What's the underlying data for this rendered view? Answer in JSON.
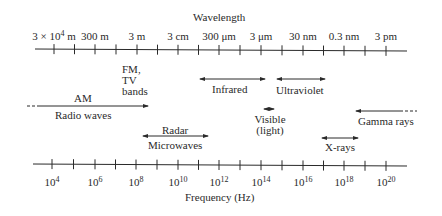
{
  "diagram": {
    "wavelength_axis": {
      "title": "Wavelength",
      "ticks": [
        {
          "label_base": "3 × 10",
          "label_exp": "4",
          "label_unit": " m",
          "x": 54
        },
        {
          "label_base": "300 m",
          "label_exp": "",
          "label_unit": "",
          "x": 95
        },
        {
          "label_base": "3 m",
          "label_exp": "",
          "label_unit": "",
          "x": 137
        },
        {
          "label_base": "3 cm",
          "label_exp": "",
          "label_unit": "",
          "x": 178
        },
        {
          "label_base": "300 μm",
          "label_exp": "",
          "label_unit": "",
          "x": 219
        },
        {
          "label_base": "3 μm",
          "label_exp": "",
          "label_unit": "",
          "x": 261
        },
        {
          "label_base": "30 nm",
          "label_exp": "",
          "label_unit": "",
          "x": 303
        },
        {
          "label_base": "0.3 nm",
          "label_exp": "",
          "label_unit": "",
          "x": 344
        },
        {
          "label_base": "3 pm",
          "label_exp": "",
          "label_unit": "",
          "x": 386
        }
      ]
    },
    "frequency_axis": {
      "title": "Frequency (Hz)",
      "ticks": [
        {
          "label_base": "10",
          "label_exp": "4",
          "x": 52
        },
        {
          "label_base": "10",
          "label_exp": "6",
          "x": 95
        },
        {
          "label_base": "10",
          "label_exp": "8",
          "x": 136
        },
        {
          "label_base": "10",
          "label_exp": "10",
          "x": 178
        },
        {
          "label_base": "10",
          "label_exp": "12",
          "x": 219
        },
        {
          "label_base": "10",
          "label_exp": "14",
          "x": 261
        },
        {
          "label_base": "10",
          "label_exp": "16",
          "x": 303
        },
        {
          "label_base": "10",
          "label_exp": "18",
          "x": 344
        },
        {
          "label_base": "10",
          "label_exp": "20",
          "x": 386
        }
      ]
    },
    "bands": {
      "am": "AM",
      "fm_tv": [
        "FM,",
        "TV",
        "bands"
      ],
      "radio_waves": "Radio waves",
      "radar": "Radar",
      "microwaves": "Microwaves",
      "infrared": "Infrared",
      "ultraviolet": "Ultraviolet",
      "visible": [
        "Visible",
        "(light)"
      ],
      "x_rays": "X-rays",
      "gamma_rays": "Gamma rays"
    },
    "colors": {
      "ink": "#2a2a2a",
      "background": "#ffffff"
    }
  }
}
